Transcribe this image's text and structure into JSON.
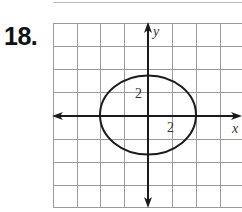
{
  "problem": {
    "number": "18."
  },
  "graph": {
    "x_axis_label": "x",
    "y_axis_label": "y",
    "x_tick_label": "2",
    "y_tick_label": "2",
    "units_per_grid_cell": 2,
    "grid_color": "#9a9a9a",
    "axis_color": "#1a1a1a",
    "curve_color": "#1a1a1a",
    "curve": {
      "type": "ellipse",
      "center": [
        0,
        0
      ],
      "semi_axis_x": 4,
      "semi_axis_y": 3.3
    }
  }
}
